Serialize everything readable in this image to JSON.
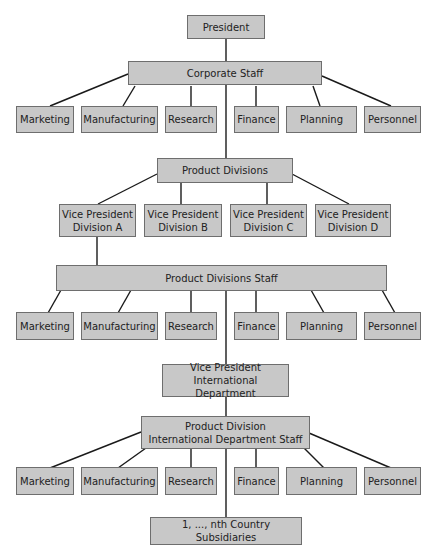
{
  "colors": {
    "box_fill": "#c8c8c8",
    "box_border": "#6e6e6e",
    "line": "#1a1a1a",
    "text": "#222222"
  },
  "nodes": {
    "president": "President",
    "corporate_staff": "Corporate Staff",
    "product_divisions": "Product Divisions",
    "vp_a": "Vice President\nDivision A",
    "vp_b": "Vice President\nDivision B",
    "vp_c": "Vice President\nDivision C",
    "vp_d": "Vice President\nDivision D",
    "product_divisions_staff": "Product Divisions Staff",
    "vp_international": "Vice President\nInternational Department",
    "intl_staff": "Product Division\nInternational Department Staff",
    "subsidiaries": "1, ..., nth Country Subsidiaries"
  },
  "functions": [
    "Marketing",
    "Manufacturing",
    "Research",
    "Finance",
    "Planning",
    "Personnel"
  ]
}
